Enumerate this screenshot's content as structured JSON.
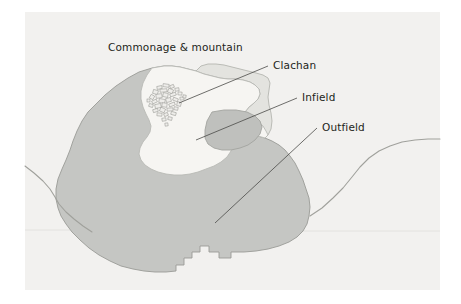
{
  "figure": {
    "kind": "land-use-map",
    "title_visible": false,
    "canvas": {
      "width": 461,
      "height": 304
    },
    "panel": {
      "name": "map-panel",
      "x": 25,
      "y": 12,
      "width": 415,
      "height": 278,
      "fill": "#f2f1ef"
    },
    "margin_fill": "#ffffff"
  },
  "colors": {
    "outer_margin": "#ffffff",
    "panel_background": "#f2f1ef",
    "outfield_fill": "#c5c6c3",
    "outfield_stroke": "#9a9b96",
    "commonage_fill": "#e3e3df",
    "commonage_stroke": "#b4b5b0",
    "infield_fill": "#f6f5f2",
    "infield_stroke": "#b9bab5",
    "clachan_fill": "#eeedea",
    "clachan_stroke": "#8e8f8a",
    "road_line": "#a0a19c",
    "leader_line": "#4a4a48",
    "label_text": "#231f20"
  },
  "labels": [
    {
      "id": "commonage",
      "name": "label-commonage-and-mountain",
      "text": "Commonage & mountain",
      "x": 108,
      "y": 51,
      "anchor": "start",
      "has_leader": false
    },
    {
      "id": "clachan",
      "name": "label-clachan",
      "text": "Clachan",
      "x": 273,
      "y": 69,
      "anchor": "start",
      "has_leader": true,
      "leader": {
        "x1": 268,
        "y1": 66,
        "x2": 179,
        "y2": 103
      }
    },
    {
      "id": "infield",
      "name": "label-infield",
      "text": "Infield",
      "x": 302,
      "y": 101,
      "anchor": "start",
      "has_leader": true,
      "leader": {
        "x1": 297,
        "y1": 98,
        "x2": 196,
        "y2": 140
      }
    },
    {
      "id": "outfield",
      "name": "label-outfield",
      "text": "Outfield",
      "x": 322,
      "y": 131,
      "anchor": "start",
      "has_leader": true,
      "leader": {
        "x1": 317,
        "y1": 128,
        "x2": 215,
        "y2": 223
      }
    }
  ],
  "regions": [
    {
      "id": "outfield-polygon",
      "name": "region-outfield",
      "label_ref": "Outfield",
      "fill": "#c5c6c3",
      "stroke": "#9a9b96",
      "path": "M 152,68 L 139,72 L 128,78 L 116,86 L 105,95 L 96,104 L 88,112 L 82,121 L 77,131 L 73,141 L 70,150 L 66,160 L 62,169 L 58,179 L 56,189 L 56,199 L 58,208 L 61,216 L 66,224 L 72,232 L 80,240 L 89,248 L 99,255 L 110,261 L 121,266 L 133,269 L 144,271 L 155,272 L 166,272 L 176,271 L 176,265 L 184,265 L 184,258 L 192,258 L 192,252 L 200,252 L 200,246 L 209,246 L 209,252 L 219,252 L 219,258 L 231,258 L 231,252 L 244,252 L 256,251 L 268,249 L 279,246 L 289,242 L 297,237 L 303,231 L 307,224 L 309,216 L 310,207 L 309,198 L 306,189 L 303,180 L 299,171 L 295,163 L 290,156 L 285,150 L 279,145 L 272,141 L 265,138 L 258,136 L 252,133 L 247,129 L 244,124 L 243,118 L 245,112 L 249,107 L 254,103 L 258,99 L 260,94 L 259,89 L 255,85 L 250,82 L 243,80 L 236,79 L 228,79 L 220,78 L 212,76 L 204,74 L 196,71 L 188,69 L 180,67 L 172,66 L 164,66 Z"
    },
    {
      "id": "commonage-polygon",
      "name": "region-commonage-and-mountain",
      "label_ref": "Commonage & mountain",
      "fill": "#e3e3df",
      "stroke": "#b4b5b0",
      "path": "M 196,71 L 204,74 L 212,76 L 220,78 L 228,79 L 236,79 L 243,80 L 250,82 L 255,85 L 259,89 L 260,94 L 258,99 L 254,103 L 249,107 L 245,112 L 243,118 L 244,124 L 247,129 L 252,133 L 258,136 L 265,138 L 268,135 L 271,129 L 272,121 L 271,113 L 269,105 L 268,97 L 269,90 L 270,83 L 268,78 L 263,75 L 256,73 L 248,71 L 240,69 L 232,67 L 224,65 L 216,64 L 208,64 L 201,66 Z"
    },
    {
      "id": "infield-polygon",
      "name": "region-infield",
      "label_ref": "Infield",
      "fill": "#f6f5f2",
      "stroke": "#b9bab5",
      "path": "M 152,68 L 147,75 L 143,83 L 141,91 L 141,99 L 143,107 L 146,114 L 149,120 L 151,126 L 150,132 L 147,137 L 143,142 L 140,148 L 139,154 L 141,160 L 145,165 L 151,169 L 158,172 L 166,174 L 174,175 L 182,175 L 190,174 L 198,172 L 206,169 L 214,166 L 221,162 L 227,157 L 231,151 L 233,145 L 233,139 L 231,133 L 229,128 L 230,123 L 234,119 L 240,117 L 246,117 L 252,119 L 258,122 L 263,126 L 266,131 L 268,135 L 265,138 L 258,136 L 252,133 L 247,129 L 244,124 L 243,118 L 245,112 L 249,107 L 254,103 L 258,99 L 260,94 L 259,89 L 255,85 L 250,82 L 243,80 L 236,79 L 228,79 L 220,78 L 212,76 L 204,74 L 196,71 L 188,69 L 180,67 L 172,66 L 164,66 Z"
    },
    {
      "id": "infield-east-lobe",
      "name": "region-infield-east-lobe",
      "label_ref": "Infield",
      "fill": "#bfc0bd",
      "stroke": "#a3a49f",
      "path": "M 212,112 L 224,110 L 236,110 L 247,112 L 255,116 L 260,121 L 262,127 L 260,134 L 255,140 L 248,145 L 240,148 L 231,150 L 222,150 L 214,148 L 208,144 L 205,138 L 205,130 L 207,121 Z"
    }
  ],
  "clachan_cluster": {
    "name": "clachan-building-cluster",
    "center_x": 167,
    "center_y": 98,
    "building_count": 34,
    "fill": "#eeedea",
    "stroke": "#8e8f8a",
    "buildings": [
      {
        "x": 157,
        "y": 86,
        "w": 5,
        "h": 3,
        "r": -12
      },
      {
        "x": 163,
        "y": 84,
        "w": 6,
        "h": 3,
        "r": 8
      },
      {
        "x": 170,
        "y": 85,
        "w": 4,
        "h": 3,
        "r": -20
      },
      {
        "x": 153,
        "y": 90,
        "w": 5,
        "h": 4,
        "r": 15
      },
      {
        "x": 160,
        "y": 89,
        "w": 7,
        "h": 3,
        "r": -5
      },
      {
        "x": 168,
        "y": 89,
        "w": 5,
        "h": 4,
        "r": 22
      },
      {
        "x": 175,
        "y": 88,
        "w": 4,
        "h": 3,
        "r": -10
      },
      {
        "x": 150,
        "y": 95,
        "w": 4,
        "h": 4,
        "r": 30
      },
      {
        "x": 156,
        "y": 94,
        "w": 6,
        "h": 4,
        "r": -8
      },
      {
        "x": 163,
        "y": 93,
        "w": 5,
        "h": 4,
        "r": 12
      },
      {
        "x": 170,
        "y": 93,
        "w": 6,
        "h": 3,
        "r": -18
      },
      {
        "x": 178,
        "y": 92,
        "w": 4,
        "h": 3,
        "r": 5
      },
      {
        "x": 152,
        "y": 100,
        "w": 5,
        "h": 3,
        "r": -25
      },
      {
        "x": 159,
        "y": 99,
        "w": 6,
        "h": 4,
        "r": 10
      },
      {
        "x": 166,
        "y": 98,
        "w": 5,
        "h": 4,
        "r": -14
      },
      {
        "x": 173,
        "y": 98,
        "w": 5,
        "h": 3,
        "r": 20
      },
      {
        "x": 180,
        "y": 97,
        "w": 4,
        "h": 3,
        "r": -6
      },
      {
        "x": 149,
        "y": 104,
        "w": 4,
        "h": 3,
        "r": 18
      },
      {
        "x": 155,
        "y": 104,
        "w": 6,
        "h": 4,
        "r": -12
      },
      {
        "x": 162,
        "y": 103,
        "w": 5,
        "h": 4,
        "r": 8
      },
      {
        "x": 169,
        "y": 103,
        "w": 6,
        "h": 3,
        "r": -22
      },
      {
        "x": 177,
        "y": 102,
        "w": 4,
        "h": 4,
        "r": 14
      },
      {
        "x": 153,
        "y": 109,
        "w": 5,
        "h": 3,
        "r": -16
      },
      {
        "x": 160,
        "y": 108,
        "w": 5,
        "h": 4,
        "r": 24
      },
      {
        "x": 167,
        "y": 108,
        "w": 6,
        "h": 3,
        "r": -4
      },
      {
        "x": 174,
        "y": 107,
        "w": 4,
        "h": 3,
        "r": 11
      },
      {
        "x": 157,
        "y": 113,
        "w": 5,
        "h": 3,
        "r": 6
      },
      {
        "x": 164,
        "y": 113,
        "w": 4,
        "h": 3,
        "r": -20
      },
      {
        "x": 171,
        "y": 112,
        "w": 5,
        "h": 3,
        "r": 16
      },
      {
        "x": 162,
        "y": 118,
        "w": 4,
        "h": 3,
        "r": -9
      },
      {
        "x": 168,
        "y": 117,
        "w": 4,
        "h": 3,
        "r": 13
      },
      {
        "x": 147,
        "y": 99,
        "w": 3,
        "h": 3,
        "r": 0
      },
      {
        "x": 183,
        "y": 95,
        "w": 3,
        "h": 3,
        "r": 10
      },
      {
        "x": 165,
        "y": 123,
        "w": 3,
        "h": 3,
        "r": -8
      }
    ]
  },
  "lines": [
    {
      "id": "road-west",
      "name": "road-line-west",
      "stroke": "#a0a19c",
      "path": "M 25,166 L 34,173 L 43,181 L 50,189 L 55,197 L 59,204 L 66,212 L 74,219 L 83,226 L 92,232"
    },
    {
      "id": "road-east",
      "name": "road-line-east",
      "stroke": "#a0a19c",
      "path": "M 310,216 L 322,208 L 333,198 L 343,188 L 352,177 L 360,167 L 369,158 L 379,151 L 390,146 L 402,142 L 415,140 L 428,139 L 440,139"
    },
    {
      "id": "field-boundary-faint",
      "name": "field-boundary-faint",
      "stroke": "#e0dfdc",
      "path": "M 25,230 L 120,230 L 230,231 L 340,231 L 440,231"
    }
  ]
}
